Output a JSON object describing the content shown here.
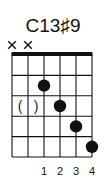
{
  "chord": {
    "name": "C13♯9",
    "strings": 6,
    "frets_shown": 5,
    "starting_fret": 1,
    "show_nut": true,
    "muted_strings": [
      1,
      2
    ],
    "dots": [
      {
        "string": 3,
        "fret": 2
      },
      {
        "string": 4,
        "fret": 3
      },
      {
        "string": 5,
        "fret": 4
      },
      {
        "string": 6,
        "fret": 5
      }
    ],
    "optional_marks": [
      {
        "fret": 3,
        "from_string": 1,
        "to_string": 2,
        "open": "(",
        "close": ")"
      }
    ],
    "finger_numbers": [
      {
        "string": 3,
        "label": "1"
      },
      {
        "string": 4,
        "label": "2"
      },
      {
        "string": 5,
        "label": "3"
      },
      {
        "string": 6,
        "label": "4"
      }
    ],
    "colors": {
      "ink": "#111111",
      "background": "#ffffff"
    }
  }
}
